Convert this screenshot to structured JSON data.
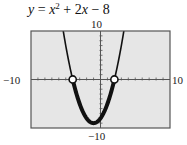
{
  "title": {
    "lhs": "y",
    "eq": " = ",
    "var1": "x",
    "exp": "2",
    "plus": " + 2",
    "var2": "x",
    "tail": " − 8"
  },
  "axis_labels": {
    "xmin": "−10",
    "xmax": "10",
    "ymin": "−10",
    "ymax": "10"
  },
  "colors": {
    "plot_bg": "#e6e6e6",
    "frame": "#555555",
    "curve": "#111111",
    "axis": "#555555",
    "marker_fill": "#ffffff"
  },
  "chart_data": {
    "type": "line",
    "function": "x^2 + 2x - 8",
    "xlabel": "",
    "ylabel": "",
    "xlim": [
      -10,
      10
    ],
    "ylim": [
      -10,
      10
    ],
    "xscale_ticks": 1,
    "yscale_ticks": 1,
    "grid": false,
    "series": [
      {
        "name": "y = x^2 + 2x - 8",
        "x": [
          -5.36,
          -5,
          -4,
          -3,
          -2,
          -1,
          0,
          1,
          2,
          3,
          3.36
        ],
        "values": [
          10,
          7,
          0,
          -5,
          -8,
          -9,
          -8,
          -5,
          0,
          7,
          10
        ]
      }
    ],
    "highlight": {
      "description": "Thick segment where y < 0 (solution of x^2 + 2x - 8 < 0)",
      "x_range": [
        -4,
        2
      ],
      "endpoints": [
        {
          "x": -4,
          "y": 0,
          "marker": "open-circle"
        },
        {
          "x": 2,
          "y": 0,
          "marker": "open-circle"
        }
      ]
    },
    "vertex": {
      "x": -1,
      "y": -9
    }
  }
}
